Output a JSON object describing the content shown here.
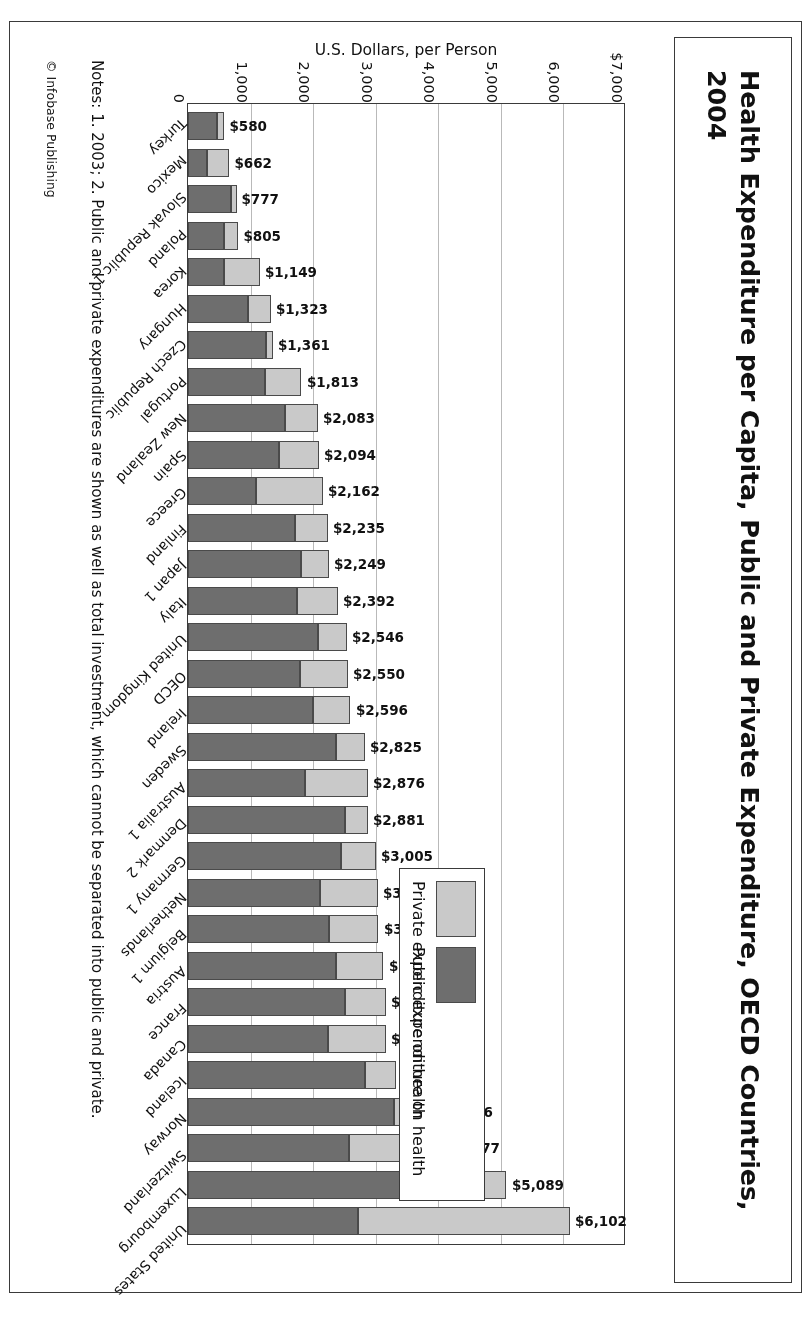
{
  "title": "Health Expenditure per Capita, Public and Private Expenditure, OECD Countries, 2004",
  "axis": {
    "ylabel": "U.S. Dollars, per Person",
    "ticks": [
      "$7,000",
      "6,000",
      "5,000",
      "4,000",
      "3,000",
      "2,000",
      "1,000",
      "0"
    ]
  },
  "legend": {
    "private_label": "Private expenditure on health",
    "public_label": "Public expenditure on health",
    "private_color": "#c9c9c9",
    "public_color": "#6e6e6e"
  },
  "notes": {
    "text": "Notes: 1. 2003; 2. Public and private expenditures are shown as well as total investment, which cannot be separated into public and private.",
    "credit": "© Infobase Publishing"
  },
  "chart_data": {
    "type": "bar",
    "orientation": "horizontal",
    "stacked": true,
    "title": "Health Expenditure per Capita, Public and Private Expenditure, OECD Countries, 2004",
    "xlabel": "U.S. Dollars, per Person",
    "ylabel": "",
    "xlim": [
      0,
      7000
    ],
    "grid": true,
    "legend_position": "upper-right",
    "categories": [
      "United States",
      "Luxembourg",
      "Switzerland",
      "Norway",
      "Iceland",
      "Canada",
      "France",
      "Austria",
      "Belgium 1",
      "Netherlands",
      "Germany 1",
      "Denmark 2",
      "Australia 1",
      "Sweden",
      "Ireland",
      "OECD",
      "United Kingdom",
      "Italy",
      "Japan 1",
      "Finland",
      "Greece",
      "Spain",
      "New Zealand",
      "Portugal",
      "Czech Republic",
      "Hungary",
      "Korea",
      "Poland",
      "Slovak Republic 1",
      "Mexico",
      "Turkey"
    ],
    "series": [
      {
        "name": "Public expenditure on health",
        "values": [
          2725,
          4500,
          2573,
          3290,
          2830,
          2235,
          2507,
          2365,
          2248,
          2109,
          2440,
          2509,
          1864,
          2363,
          2000,
          1790,
          2081,
          1742,
          1800,
          1704,
          1085,
          1455,
          1556,
          1236,
          1250,
          958,
          575,
          571,
          684,
          300,
          470
        ]
      },
      {
        "name": "Private expenditure on health",
        "values": [
          3377,
          589,
          1504,
          676,
          501,
          930,
          652,
          759,
          796,
          935,
          565,
          372,
          1012,
          462,
          596,
          760,
          465,
          650,
          449,
          531,
          1077,
          639,
          527,
          577,
          111,
          365,
          574,
          234,
          93,
          362,
          110
        ]
      }
    ],
    "totals": [
      6102,
      5089,
      4077,
      3966,
      3331,
      3165,
      3159,
      3124,
      3044,
      3041,
      3005,
      2881,
      2876,
      2825,
      2596,
      2550,
      2546,
      2392,
      2249,
      2235,
      2162,
      2094,
      2083,
      1813,
      1361,
      1323,
      1149,
      805,
      777,
      662,
      580
    ],
    "total_labels": [
      "$6,102",
      "$5,089",
      "$4,077",
      "$3,966",
      "$3,331",
      "$3,165",
      "$3,159",
      "$3,124",
      "$3,044",
      "$3,041",
      "$3,005",
      "$2,881",
      "$2,876",
      "$2,825",
      "$2,596",
      "$2,550",
      "$2,546",
      "$2,392",
      "$2,249",
      "$2,235",
      "$2,162",
      "$2,094",
      "$2,083",
      "$1,813",
      "$1,361",
      "$1,323",
      "$1,149",
      "$805",
      "$777",
      "$662",
      "$580"
    ]
  }
}
